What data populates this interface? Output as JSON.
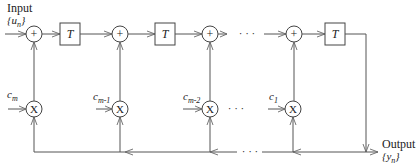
{
  "diagram": {
    "type": "filter-structure",
    "input_label": "Input",
    "input_signal": "{u",
    "input_sub": "n",
    "input_close": "}",
    "output_label": "Output",
    "output_signal": "{y",
    "output_sub": "n",
    "output_close": "}",
    "delay_label": "T",
    "adder_symbol": "+",
    "multiplier_symbol": "X",
    "ellipsis": "· · ·",
    "coefficients": [
      {
        "base": "c",
        "sub": "m"
      },
      {
        "base": "c",
        "sub": "m-1"
      },
      {
        "base": "c",
        "sub": "m-2"
      },
      {
        "base": "c",
        "sub": "1"
      }
    ]
  }
}
